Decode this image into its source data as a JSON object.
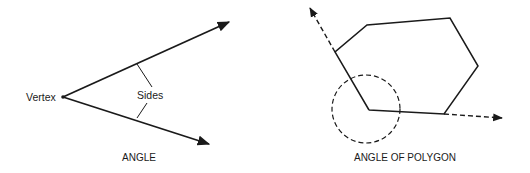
{
  "figure": {
    "left_panel": {
      "caption": "ANGLE",
      "labels": {
        "vertex": "Vertex",
        "sides": "Sides"
      },
      "vertex_point": [
        63,
        97
      ],
      "rays": [
        {
          "name": "upper-side",
          "from": [
            63,
            97
          ],
          "to": [
            230,
            22
          ]
        },
        {
          "name": "lower-side",
          "from": [
            63,
            97
          ],
          "to": [
            210,
            144
          ]
        }
      ]
    },
    "right_panel": {
      "caption": "ANGLE OF POLYGON",
      "polygon_vertices": [
        [
          369,
          110
        ],
        [
          335,
          52
        ],
        [
          367,
          25
        ],
        [
          450,
          18
        ],
        [
          478,
          66
        ],
        [
          444,
          114
        ]
      ],
      "extended_sides": [
        {
          "name": "left-extension",
          "from": [
            335,
            52
          ],
          "to": [
            309,
            6
          ],
          "style": "dashed"
        },
        {
          "name": "bottom-extension",
          "from": [
            444,
            114
          ],
          "to": [
            503,
            118
          ],
          "style": "dashed"
        }
      ],
      "angle_marker": {
        "shape": "circle",
        "style": "dashed",
        "center": [
          366,
          109
        ],
        "radius": 34
      }
    },
    "colors": {
      "stroke": "#1a1a1a",
      "background": "#ffffff"
    }
  }
}
